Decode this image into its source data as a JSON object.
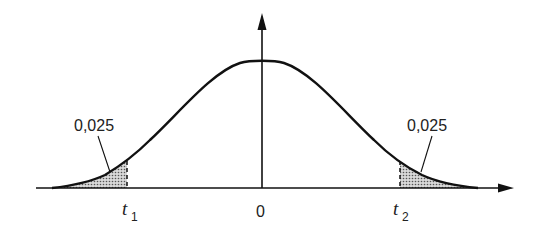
{
  "figure": {
    "type": "t-distribution two-tailed critical region",
    "x_axis_origin_label": "0",
    "left_critical": {
      "symbol": "t",
      "subscript": "1"
    },
    "right_critical": {
      "symbol": "t",
      "subscript": "2"
    },
    "left_tail_area_label": "0,025",
    "right_tail_area_label": "0,025",
    "colors": {
      "stroke": "#111111",
      "shade": "#9a9a9a"
    }
  }
}
